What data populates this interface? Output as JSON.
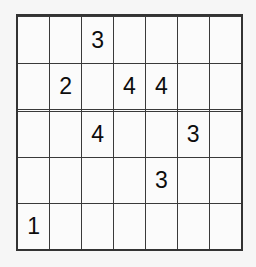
{
  "puzzle": {
    "type": "number-placement-grid",
    "rows": 7,
    "columns": 7,
    "background_color": "#f6f6f6",
    "cell_background_color": "#fbfbfb",
    "grid_line_color": "#3a3a3a",
    "border_color": "#333333",
    "digit_color": "#0d0d0d",
    "empty_cell_label": "",
    "cells": [
      [
        "",
        "",
        "",
        "",
        "",
        "",
        ""
      ],
      [
        "",
        "",
        "3",
        "",
        "",
        "",
        ""
      ],
      [
        "",
        "2",
        "",
        "4",
        "4",
        "",
        ""
      ],
      [
        "",
        "",
        "",
        "",
        "",
        "",
        ""
      ],
      [
        "",
        "",
        "4",
        "",
        "",
        "3",
        ""
      ],
      [
        "",
        "",
        "",
        "",
        "3",
        "",
        ""
      ],
      [
        "1",
        "",
        "",
        "",
        "",
        "",
        ""
      ]
    ],
    "given_count": 8
  }
}
